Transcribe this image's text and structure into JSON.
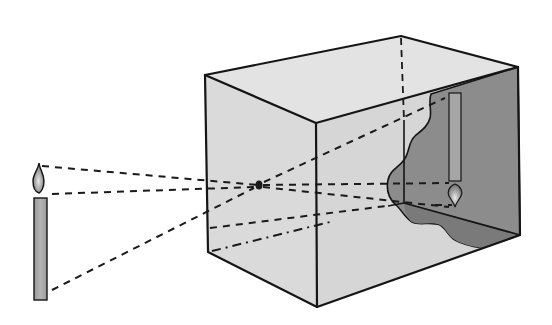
{
  "diagram": {
    "elements": {
      "object": "candle",
      "aperture": "pinhole",
      "enclosure": "box",
      "image": "inverted candle image on back wall"
    },
    "colors": {
      "background": "#ffffff",
      "box_face": "#dcdcdc",
      "box_top": "#e2e2e2",
      "box_inside": "#8a8a8a",
      "box_inside_floor": "#7c7c7c",
      "candle_body": "#a9a9a9",
      "flame": "#9a9a9a",
      "outline": "#151515"
    }
  }
}
